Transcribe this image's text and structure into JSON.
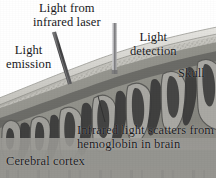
{
  "figure": {
    "type": "grayscale-anatomical-illustration",
    "width": 216,
    "height": 178,
    "background_color": "#ffffff"
  },
  "labels": {
    "laser": "Light from\ninfrared laser",
    "emission": "Light\nemission",
    "detection": "Light\ndetection",
    "skull": "Skull",
    "scatter": "Infrared light scatters from\nhemoglobin in brain",
    "cortex": "Cerebral cortex"
  },
  "parts": {
    "emission_probe": "emission-probe",
    "detection_probe": "detection-probe",
    "skull_layer": "skull-layer",
    "scalp_layer": "scalp-layer",
    "diploe_texture": "diploe-texture",
    "cortex_region": "cerebral-cortex",
    "gyri": "cortical-gyri",
    "sulci": "cortical-sulci",
    "leader_line_scatter": "scatter-leader-line",
    "leader_line_emission": "emission-leader-line"
  },
  "colors": {
    "paper": "#ffffff",
    "text": "#18181a",
    "scalp_light": "#d9d8d4",
    "skull_band": "#c9c8c3",
    "diploe": "#b4b3ad",
    "cortex_mid": "#8e8d89",
    "cortex_light": "#a7a6a1",
    "sulcus_dark": "#3a3a3a",
    "gyrus_outline": "#5d5d5b",
    "probe_dark": "#4a4a4c",
    "probe_light": "#9a9a9c"
  },
  "geometry": {
    "skull_arc_note": "curved band sweeping from lower-left up to upper-right",
    "emission_probe_angle_deg": 28,
    "detection_probe_angle_deg": 0,
    "gyri_count": 7
  }
}
